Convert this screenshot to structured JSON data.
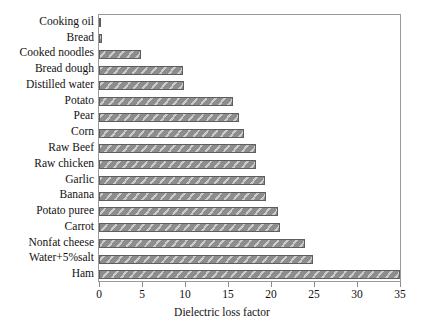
{
  "chart_data": {
    "type": "bar",
    "orientation": "horizontal",
    "title": "",
    "xlabel": "Dielectric loss factor",
    "ylabel": "",
    "xlim": [
      0,
      35
    ],
    "ylim": null,
    "xticks": [
      0,
      5,
      10,
      15,
      20,
      25,
      30,
      35
    ],
    "grid": false,
    "legend": null,
    "bar_color": "#8d8d8d",
    "bar_edge_color": "#5e5e5e",
    "bar_pattern": "diagonal-hatch",
    "categories": [
      "Cooking oil",
      "Bread",
      "Cooked noodles",
      "Bread dough",
      "Distilled water",
      "Potato",
      "Pear",
      "Corn",
      "Raw Beef",
      "Raw chicken",
      "Garlic",
      "Banana",
      "Potato puree",
      "Carrot",
      "Nonfat cheese",
      "Water+5%salt",
      "Ham"
    ],
    "values": [
      0.15,
      0.3,
      4.9,
      9.8,
      9.9,
      15.6,
      16.3,
      16.9,
      18.2,
      18.3,
      19.3,
      19.4,
      20.8,
      21.0,
      24.0,
      24.9,
      35.3
    ]
  },
  "axis": {
    "x_tick_labels": [
      "0",
      "5",
      "10",
      "15",
      "20",
      "25",
      "30",
      "35"
    ],
    "x_title": "Dielectric loss factor"
  }
}
